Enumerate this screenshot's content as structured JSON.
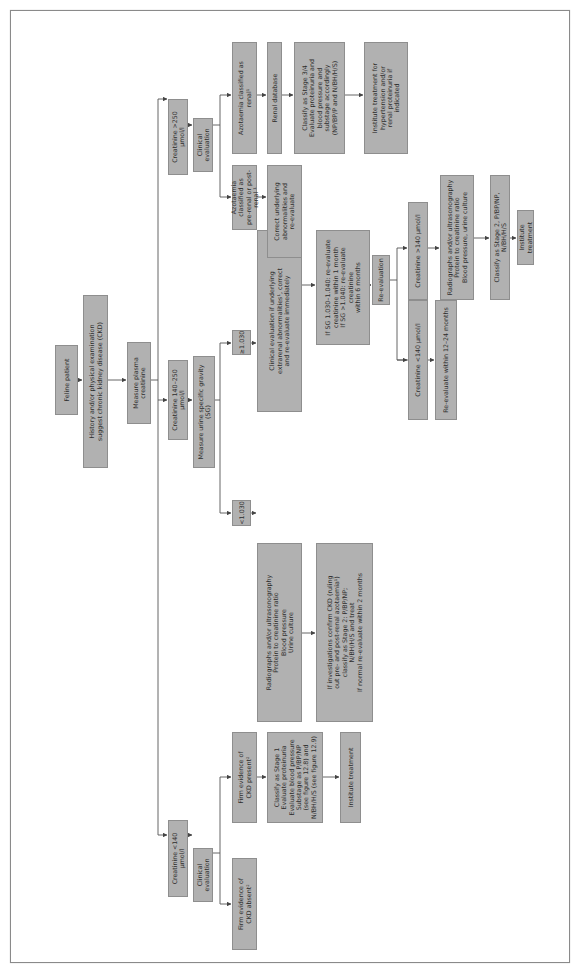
{
  "diagram": {
    "orientation": "rotated 90deg counter-clockwise",
    "box_fill": "#b1b1b1",
    "box_border": "#8e8e8e",
    "line_color": "#555555",
    "nodes": {
      "feline_patient": "Feline patient",
      "history": "History and/or physical examination\nsuggest chronic kidney disease (CKD)",
      "measure_creatinine": "Measure plasma creatinine",
      "creat_lt140": "Creatinine <140 µmol/l",
      "creat_140_250": "Creatinine 140–250 µmol/l",
      "creat_gt250": "Creatinine >250 µmol/l",
      "clin_eval_low": "Clinical evaluation",
      "measure_sg": "Measure urine specific gravity (SG)",
      "clin_eval_high": "Clinical evaluation",
      "ckd_absent": "Firm evidence of\nCKD absent²",
      "ckd_present": "Firm evidence of\nCKD present²",
      "sg_lt1030": "<1.030",
      "sg_ge1030": "≥1.030",
      "azot_prerenal": "Azotaemia classified as\npre-renal or post-renal ¹",
      "azot_renal": "Azotaemia classified as\nrenal¹",
      "classify_stage1": "Classify as Stage 1\nEvaluate proteinuria\nEvaluate blood pressure\nSubstage as P/BP/NP\n(see figure 12.8) and\nN/BH/H/S (see figure 12.9)",
      "radiographs_1": "Radiographs and/or ultrasonography\nProtein to creatinine ratio\nBlood pressure\nUrine culture",
      "clin_eval_extrarenal": "Clinical evaluation if underlying\nextrarenal abnormalities¹, correct\nand re-evaluate immediately",
      "correct_underlying": "Correct underlying\nabnormalities and\nre-evaluate",
      "renal_database": "Renal database",
      "institute_treatment_1": "Institute treatment",
      "investigations_confirm": "If investigations confirm CKD (ruling\nout pre- and post-renal azotaemia¹)\nclassify as Stage 2: P/BP/NP;\nN/BH/H/S and treat\nIf normal re-evaluate within 2 months",
      "if_sg": "If SG 1.030–1.040: re-evaluate\ncreatinine within 1 month\nIf SG >1.040: re-evaluate creatinine\nwithin 6 months",
      "re_evaluation": "Re-evaluation",
      "classify_stage34": "Classify as Stage 3/4\nEvaluate proteinuria and\nblood pressure and\nsubstage accordingly\n(NP/BP/P and N/BH/H/S)",
      "institute_hypertension": "Institute treatment for\nhypertension and/or\nrenal proteinuria if\nindicated",
      "re_creat_lt140": "Creatinine <140 µmol/l",
      "re_creat_gt140": "Creatinine >140 µmol/l",
      "re_evaluate_12_24": "Re-evaluate within 12–24 months",
      "radiographs_2": "Radiographs and/or ultrasonography\nProtein to creatinine ratio\nBlood pressure, urine culture",
      "classify_stage2": "Classify as Stage 2, P/BP/NP, N/BH/H/S",
      "institute_treatment_2": "Institute treatment"
    }
  }
}
